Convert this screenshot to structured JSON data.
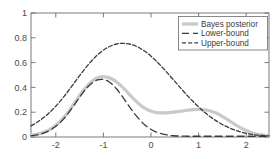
{
  "chart_data": {
    "type": "line",
    "title": "",
    "xlabel": "",
    "ylabel": "",
    "xlim": [
      -2.5,
      2.5
    ],
    "ylim": [
      0,
      1
    ],
    "grid": false,
    "legend_position": "top-right",
    "xticks": [
      -2,
      -1,
      0,
      1,
      2
    ],
    "xticklabels": [
      "-2",
      "-1",
      "0",
      "1",
      "2"
    ],
    "yticks": [
      0,
      0.2,
      0.4,
      0.6,
      0.8,
      1
    ],
    "yticklabels": [
      "0",
      "0.2",
      "0.4",
      "0.6",
      "0.8",
      "1"
    ],
    "x": [
      -2.5,
      -2.4,
      -2.3,
      -2.2,
      -2.1,
      -2.0,
      -1.9,
      -1.8,
      -1.7,
      -1.6,
      -1.5,
      -1.4,
      -1.3,
      -1.2,
      -1.1,
      -1.0,
      -0.9,
      -0.8,
      -0.7,
      -0.6,
      -0.5,
      -0.4,
      -0.3,
      -0.2,
      -0.1,
      0.0,
      0.1,
      0.2,
      0.3,
      0.4,
      0.5,
      0.6,
      0.7,
      0.8,
      0.9,
      1.0,
      1.1,
      1.2,
      1.3,
      1.4,
      1.5,
      1.6,
      1.7,
      1.8,
      1.9,
      2.0,
      2.1,
      2.2,
      2.3,
      2.4,
      2.5
    ],
    "series": [
      {
        "name": "Bayes posterior",
        "style": "solid",
        "color": "#c9c9c9",
        "width": 3.2,
        "values": [
          0.012,
          0.019,
          0.029,
          0.043,
          0.062,
          0.088,
          0.121,
          0.162,
          0.211,
          0.266,
          0.322,
          0.375,
          0.421,
          0.456,
          0.478,
          0.487,
          0.483,
          0.468,
          0.443,
          0.41,
          0.371,
          0.33,
          0.291,
          0.257,
          0.23,
          0.211,
          0.2,
          0.195,
          0.194,
          0.196,
          0.2,
          0.205,
          0.211,
          0.216,
          0.22,
          0.222,
          0.221,
          0.216,
          0.206,
          0.191,
          0.171,
          0.148,
          0.123,
          0.098,
          0.075,
          0.056,
          0.04,
          0.028,
          0.019,
          0.014,
          0.011
        ]
      },
      {
        "name": "Lower-bound",
        "style": "dashed",
        "color": "#3a3a3a",
        "width": 1.3,
        "values": [
          0.009,
          0.015,
          0.024,
          0.037,
          0.055,
          0.08,
          0.112,
          0.152,
          0.2,
          0.254,
          0.31,
          0.362,
          0.407,
          0.44,
          0.46,
          0.465,
          0.454,
          0.427,
          0.387,
          0.337,
          0.282,
          0.227,
          0.176,
          0.132,
          0.095,
          0.067,
          0.046,
          0.031,
          0.021,
          0.014,
          0.01,
          0.008,
          0.007,
          0.006,
          0.006,
          0.006,
          0.006,
          0.006,
          0.006,
          0.006,
          0.006,
          0.006,
          0.006,
          0.006,
          0.006,
          0.006,
          0.006,
          0.006,
          0.006,
          0.006,
          0.006
        ]
      },
      {
        "name": "Upper-bound",
        "style": "dashdot",
        "color": "#3a3a3a",
        "width": 1.3,
        "values": [
          0.09,
          0.112,
          0.137,
          0.167,
          0.201,
          0.24,
          0.283,
          0.33,
          0.38,
          0.432,
          0.484,
          0.534,
          0.582,
          0.625,
          0.663,
          0.695,
          0.72,
          0.738,
          0.75,
          0.755,
          0.754,
          0.747,
          0.734,
          0.714,
          0.689,
          0.659,
          0.624,
          0.586,
          0.545,
          0.502,
          0.458,
          0.414,
          0.37,
          0.328,
          0.288,
          0.25,
          0.215,
          0.183,
          0.154,
          0.128,
          0.105,
          0.085,
          0.068,
          0.053,
          0.041,
          0.031,
          0.024,
          0.018,
          0.014,
          0.011,
          0.009
        ]
      }
    ]
  },
  "legend": {
    "entries": [
      {
        "label": "Bayes posterior"
      },
      {
        "label": "Lower-bound"
      },
      {
        "label": "Upper-bound"
      }
    ]
  },
  "colors": {
    "axis": "#6b6b6b",
    "bayes": "#c9c9c9",
    "bound": "#3a3a3a",
    "background": "#ffffff",
    "text": "#4a4a4a"
  }
}
